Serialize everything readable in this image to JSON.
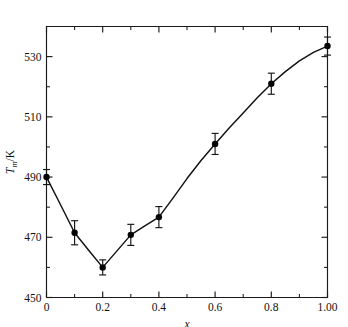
{
  "running_head": "STRUCTURE   NUCLEAR MAGNETIC",
  "chart_data": {
    "type": "scatter",
    "title": "",
    "xlabel": "x",
    "ylabel": "T_m/K",
    "ylabel_parts": {
      "symbol": "T",
      "subscript": "m",
      "unit": "/K"
    },
    "xlim": [
      0,
      1.0
    ],
    "ylim": [
      450,
      540
    ],
    "grid": false,
    "legend": null,
    "x_ticks": [
      0,
      0.2,
      0.4,
      0.6,
      0.8,
      1.0
    ],
    "x_ticklabels": [
      "0",
      "0.2",
      "0.4",
      "0.6",
      "0.8",
      "1.00"
    ],
    "x_minor_ticks": [
      0.1,
      0.3,
      0.5,
      0.7,
      0.9
    ],
    "y_ticks": [
      450,
      470,
      490,
      510,
      530
    ],
    "y_ticklabels": [
      "450",
      "470",
      "490",
      "510",
      "530"
    ],
    "y_minor_ticks": [
      460,
      480,
      500,
      520
    ],
    "points": [
      {
        "x": 0.0,
        "y": 490.0,
        "yerr": 2.5
      },
      {
        "x": 0.1,
        "y": 471.5,
        "yerr": 4.0
      },
      {
        "x": 0.2,
        "y": 460.0,
        "yerr": 2.5
      },
      {
        "x": 0.3,
        "y": 470.8,
        "yerr": 3.5
      },
      {
        "x": 0.4,
        "y": 476.7,
        "yerr": 3.5
      },
      {
        "x": 0.6,
        "y": 501.0,
        "yerr": 3.5
      },
      {
        "x": 0.8,
        "y": 521.0,
        "yerr": 3.5
      },
      {
        "x": 1.0,
        "y": 533.5,
        "yerr": 3.0
      }
    ],
    "curve": [
      {
        "x": 0.0,
        "y": 490.0
      },
      {
        "x": 0.05,
        "y": 480.8
      },
      {
        "x": 0.1,
        "y": 471.5
      },
      {
        "x": 0.15,
        "y": 465.7
      },
      {
        "x": 0.2,
        "y": 460.0
      },
      {
        "x": 0.25,
        "y": 465.4
      },
      {
        "x": 0.3,
        "y": 470.8
      },
      {
        "x": 0.35,
        "y": 473.8
      },
      {
        "x": 0.4,
        "y": 476.7
      },
      {
        "x": 0.45,
        "y": 483.0
      },
      {
        "x": 0.5,
        "y": 489.5
      },
      {
        "x": 0.55,
        "y": 495.5
      },
      {
        "x": 0.6,
        "y": 501.0
      },
      {
        "x": 0.65,
        "y": 506.3
      },
      {
        "x": 0.7,
        "y": 511.3
      },
      {
        "x": 0.75,
        "y": 516.3
      },
      {
        "x": 0.8,
        "y": 521.0
      },
      {
        "x": 0.85,
        "y": 525.0
      },
      {
        "x": 0.9,
        "y": 528.6
      },
      {
        "x": 0.95,
        "y": 531.4
      },
      {
        "x": 1.0,
        "y": 533.5
      }
    ]
  }
}
